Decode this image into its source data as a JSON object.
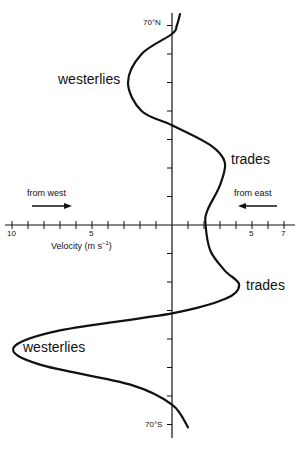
{
  "chart_data": {
    "type": "line",
    "title": "",
    "orientation": "vertical-profile",
    "xlabel": "Velocity (m s⁻¹)",
    "ylabel": "Latitude",
    "x_ticks": [
      -10,
      -9,
      -8,
      -7,
      -6,
      -5,
      -4,
      -3,
      -2,
      -1,
      0,
      1,
      2,
      3,
      4,
      5,
      6,
      7
    ],
    "x_tick_labels": [
      {
        "value": -10,
        "label": "10"
      },
      {
        "value": -5,
        "label": "5"
      },
      {
        "value": 5,
        "label": "5"
      },
      {
        "value": 7,
        "label": "7"
      }
    ],
    "xlim": [
      -10,
      7.5
    ],
    "y_ticks": [
      70,
      60,
      50,
      40,
      30,
      20,
      10,
      0,
      -10,
      -20,
      -30,
      -40,
      -50,
      -60,
      -70
    ],
    "y_tick_labels": [
      {
        "value": 70,
        "label": "70°N"
      },
      {
        "value": -70,
        "label": "70°S"
      }
    ],
    "ylim": [
      -75,
      75
    ],
    "grid": false,
    "series": [
      {
        "name": "zonal wind velocity",
        "note": "positive = from east (easterly), negative = from west (westerly)",
        "points": [
          {
            "lat": 74,
            "v": 0.5
          },
          {
            "lat": 70,
            "v": 0.3
          },
          {
            "lat": 67,
            "v": 0.0
          },
          {
            "lat": 60,
            "v": -1.9
          },
          {
            "lat": 50,
            "v": -2.75
          },
          {
            "lat": 40,
            "v": -1.9
          },
          {
            "lat": 35,
            "v": 0.0
          },
          {
            "lat": 28,
            "v": 2.4
          },
          {
            "lat": 22,
            "v": 3.3
          },
          {
            "lat": 14,
            "v": 3.0
          },
          {
            "lat": 5,
            "v": 2.2
          },
          {
            "lat": 0,
            "v": 2.1
          },
          {
            "lat": -9,
            "v": 2.4
          },
          {
            "lat": -16,
            "v": 3.3
          },
          {
            "lat": -21,
            "v": 4.2
          },
          {
            "lat": -26,
            "v": 3.3
          },
          {
            "lat": -31,
            "v": 0.0
          },
          {
            "lat": -37,
            "v": -7.0
          },
          {
            "lat": -43,
            "v": -9.9
          },
          {
            "lat": -49,
            "v": -8.25
          },
          {
            "lat": -56,
            "v": -2.6
          },
          {
            "lat": -63,
            "v": 0.0
          },
          {
            "lat": -71,
            "v": 1.0
          }
        ]
      }
    ],
    "annotations": [
      {
        "text": "westerlies",
        "lat": 50,
        "side": "left"
      },
      {
        "text": "trades",
        "lat": 22,
        "side": "right"
      },
      {
        "text": "trades",
        "lat": -21,
        "side": "right"
      },
      {
        "text": "westerlies",
        "lat": -43,
        "side": "left"
      },
      {
        "text": "from west",
        "direction_arrow": "right",
        "side": "left"
      },
      {
        "text": "from east",
        "direction_arrow": "left",
        "side": "right"
      }
    ]
  },
  "labels": {
    "lat_top": "70°N",
    "lat_bottom": "70°S",
    "westerlies_north": "westerlies",
    "trades_north": "trades",
    "trades_south": "trades",
    "westerlies_south": "westerlies",
    "from_west": "from west",
    "from_east": "from east",
    "xlabel_text": "Velocity (m s",
    "xlabel_sup": "−1",
    "xlabel_close": ")",
    "tick_10": "10",
    "tick_5_left": "5",
    "tick_5_right": "5",
    "tick_7": "7"
  }
}
